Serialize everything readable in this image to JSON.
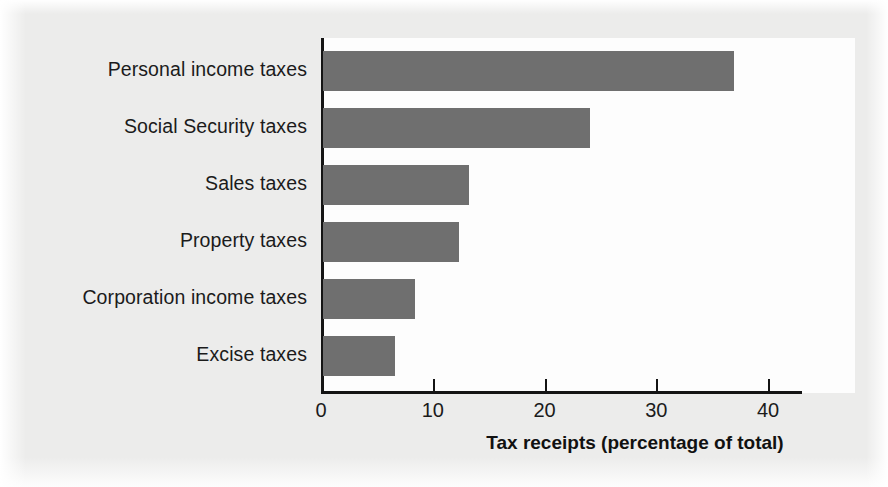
{
  "chart_data": {
    "type": "bar",
    "orientation": "horizontal",
    "title": "",
    "categories": [
      "Personal income taxes",
      "Social Security taxes",
      "Sales taxes",
      "Property taxes",
      "Corporation income taxes",
      "Excise taxes"
    ],
    "values": [
      36.8,
      23.9,
      13.1,
      12.2,
      8.2,
      6.4
    ],
    "xlabel": "Tax receipts (percentage of total)",
    "ylabel": "",
    "xlim": [
      0,
      40
    ],
    "xticks": [
      0,
      10,
      20,
      30,
      40
    ],
    "xtick_labels": [
      "0",
      "10",
      "20",
      "30",
      "40"
    ],
    "grid": false,
    "legend": false,
    "bar_color": "#6f6f6f",
    "axis_color": "#141414",
    "plot_background": "#fdfdfd",
    "page_background": "#ececeb"
  }
}
